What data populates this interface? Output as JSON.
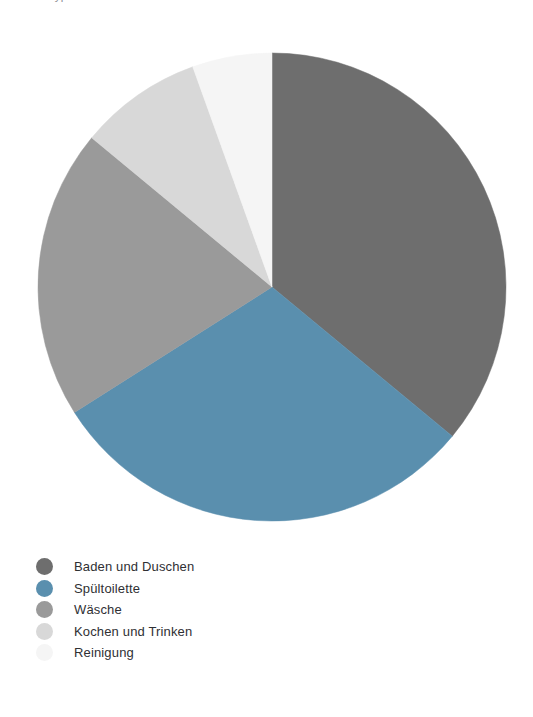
{
  "page": {
    "clipped_caption": "Typischer Wasserverbrauch im Haushalt nach unterschiedlichen Zwecken"
  },
  "chart_data": {
    "type": "pie",
    "title": "",
    "subtitle": "",
    "xlabel": "",
    "ylabel": "",
    "grid": false,
    "legend_position": "bottom-left",
    "start_angle_deg": 0,
    "direction": "clockwise",
    "center": {
      "x": 272,
      "y": 287
    },
    "radius": 234,
    "categories": [
      "Baden und Duschen",
      "Spültoilette",
      "Wäsche",
      "Kochen und Trinken",
      "Reinigung"
    ],
    "values": [
      36,
      30,
      20,
      8.5,
      5.5
    ],
    "unit": "%",
    "colors": [
      "#6e6e6e",
      "#5a8fae",
      "#9a9a9a",
      "#d8d8d8",
      "#f5f5f5"
    ],
    "slices": [
      {
        "label": "Baden und Duschen",
        "value": 36,
        "color": "#6e6e6e",
        "start_deg": 0,
        "end_deg": 129.6
      },
      {
        "label": "Spültoilette",
        "value": 30,
        "color": "#5a8fae",
        "start_deg": 129.6,
        "end_deg": 237.6
      },
      {
        "label": "Wäsche",
        "value": 20,
        "color": "#9a9a9a",
        "start_deg": 237.6,
        "end_deg": 309.6
      },
      {
        "label": "Kochen und Trinken",
        "value": 8.5,
        "color": "#d8d8d8",
        "start_deg": 309.6,
        "end_deg": 340.2
      },
      {
        "label": "Reinigung",
        "value": 5.5,
        "color": "#f5f5f5",
        "start_deg": 340.2,
        "end_deg": 360
      }
    ]
  },
  "legend": {
    "items": [
      {
        "label": "Baden und Duschen",
        "color": "#6e6e6e"
      },
      {
        "label": "Spültoilette",
        "color": "#5a8fae"
      },
      {
        "label": "Wäsche",
        "color": "#9a9a9a"
      },
      {
        "label": "Kochen und Trinken",
        "color": "#d8d8d8"
      },
      {
        "label": "Reinigung",
        "color": "#f5f5f5"
      }
    ]
  }
}
